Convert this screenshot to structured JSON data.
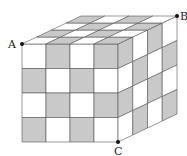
{
  "figure": {
    "grid_size": 4,
    "colors": {
      "shaded": "#c9c9c9",
      "unshaded": "#ffffff",
      "edge": "#555555",
      "point": "#111111"
    },
    "geometry": {
      "front_top_left": [
        22,
        44
      ],
      "front_size": [
        96,
        98
      ],
      "depth_vector": [
        59,
        -28
      ]
    },
    "faces": {
      "front": [
        [
          0,
          1,
          0,
          1
        ],
        [
          1,
          0,
          1,
          0
        ],
        [
          0,
          1,
          0,
          1
        ],
        [
          1,
          0,
          1,
          0
        ]
      ],
      "right": [
        [
          1,
          0,
          1,
          0
        ],
        [
          0,
          1,
          0,
          1
        ],
        [
          1,
          0,
          1,
          0
        ],
        [
          0,
          1,
          0,
          1
        ]
      ],
      "top": [
        [
          0,
          1,
          0,
          1
        ],
        [
          1,
          0,
          1,
          0
        ],
        [
          0,
          1,
          0,
          1
        ],
        [
          1,
          0,
          1,
          0
        ]
      ]
    },
    "points": [
      {
        "label": "A",
        "pos": [
          22,
          44
        ],
        "label_pos": [
          8,
          48
        ]
      },
      {
        "label": "B",
        "pos": [
          177,
          16
        ],
        "label_pos": [
          180,
          20
        ]
      },
      {
        "label": "C",
        "pos": [
          118,
          142
        ],
        "label_pos": [
          114,
          155
        ]
      }
    ]
  }
}
